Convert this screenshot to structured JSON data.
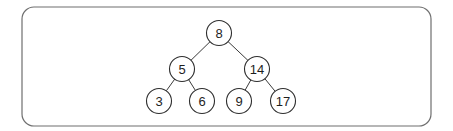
{
  "diagram": {
    "type": "binary-search-tree",
    "frame": {
      "x": 22,
      "y": 7,
      "width": 409,
      "height": 119,
      "radius": 12
    },
    "style": {
      "frame_stroke": "#6f6f6f",
      "edge_stroke": "#3a3a3a",
      "node_stroke": "#2e2e2e",
      "node_fill": "#ffffff",
      "label_color": "#1e1e1e"
    },
    "node_radius": 12.5,
    "nodes": [
      {
        "id": "n8",
        "label": "8",
        "x": 219,
        "y": 33
      },
      {
        "id": "n5",
        "label": "5",
        "x": 182,
        "y": 69
      },
      {
        "id": "n14",
        "label": "14",
        "x": 257,
        "y": 69
      },
      {
        "id": "n3",
        "label": "3",
        "x": 159,
        "y": 101
      },
      {
        "id": "n6",
        "label": "6",
        "x": 202,
        "y": 101
      },
      {
        "id": "n9",
        "label": "9",
        "x": 239,
        "y": 101
      },
      {
        "id": "n17",
        "label": "17",
        "x": 283,
        "y": 101
      }
    ],
    "edges": [
      {
        "from": "n8",
        "to": "n5"
      },
      {
        "from": "n8",
        "to": "n14"
      },
      {
        "from": "n5",
        "to": "n3"
      },
      {
        "from": "n5",
        "to": "n6"
      },
      {
        "from": "n14",
        "to": "n9"
      },
      {
        "from": "n14",
        "to": "n17"
      }
    ]
  }
}
